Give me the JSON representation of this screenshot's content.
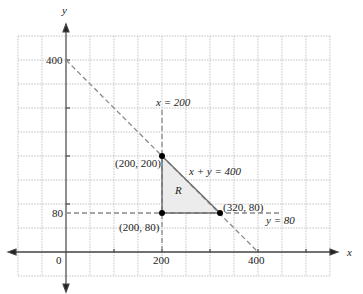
{
  "diagram": {
    "type": "linear-programming-feasible-region",
    "axes": {
      "x_label": "x",
      "y_label": "y",
      "origin_label": "0",
      "x_ticks": [
        "200",
        "400"
      ],
      "y_ticks": [
        "80",
        "400"
      ]
    },
    "lines": [
      {
        "equation": "x = 200",
        "style": "dashed"
      },
      {
        "equation": "y = 80",
        "style": "dashed"
      },
      {
        "equation": "x + y = 400",
        "style": "dashed"
      }
    ],
    "region_label": "R",
    "vertices": [
      {
        "label": "(200, 200)",
        "x": 200,
        "y": 200
      },
      {
        "label": "(200, 80)",
        "x": 200,
        "y": 80
      },
      {
        "label": "(320, 80)",
        "x": 320,
        "y": 80
      }
    ],
    "colors": {
      "grid": "#aaaaaa",
      "axis": "#333333",
      "region_fill": "#ececec",
      "dashed_line": "#888888",
      "boundary": "#777777",
      "point": "#000000"
    }
  }
}
